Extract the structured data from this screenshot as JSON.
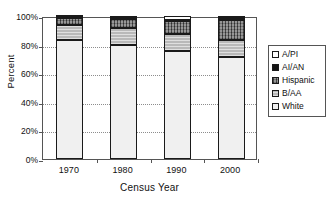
{
  "chart_data": {
    "type": "bar",
    "subtype": "100% stacked column",
    "title": "",
    "xlabel": "Census Year",
    "ylabel": "Percent",
    "categories": [
      "1970",
      "1980",
      "1990",
      "2000"
    ],
    "ylim": [
      0,
      100
    ],
    "yticks": [
      "0%",
      "20%",
      "40%",
      "60%",
      "80%",
      "100%"
    ],
    "ytick_values": [
      0,
      20,
      40,
      60,
      80,
      100
    ],
    "grid": true,
    "grid_orientation": "horizontal",
    "legend_position": "right",
    "series": [
      {
        "name": "White",
        "values": [
          83.0,
          80.0,
          75.5,
          71.0
        ],
        "fill": "dots",
        "color": "#f0f0f0"
      },
      {
        "name": "B/AA",
        "values": [
          11.0,
          11.5,
          11.8,
          12.2
        ],
        "fill": "gray",
        "color": "#b9b9b9"
      },
      {
        "name": "Hispanic",
        "values": [
          4.5,
          6.4,
          9.0,
          14.3
        ],
        "fill": "hatch",
        "color": "#6e6e6e"
      },
      {
        "name": "AI/AN",
        "values": [
          0.7,
          0.8,
          0.9,
          0.9
        ],
        "fill": "black",
        "color": "#141414"
      },
      {
        "name": "A/PI",
        "values": [
          0.8,
          1.3,
          2.8,
          1.6
        ],
        "fill": "white",
        "color": "#ffffff"
      }
    ],
    "legend_order_top_to_bottom": [
      "A/PI",
      "AI/AN",
      "Hispanic",
      "B/AA",
      "White"
    ]
  },
  "legend": {
    "items": [
      {
        "label": "A/PI"
      },
      {
        "label": "AI/AN"
      },
      {
        "label": "Hispanic"
      },
      {
        "label": "B/AA"
      },
      {
        "label": "White"
      }
    ]
  }
}
